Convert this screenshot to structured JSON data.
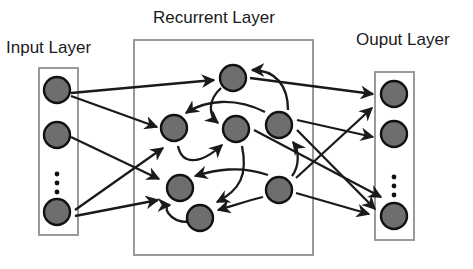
{
  "labels": {
    "input": "Input Layer",
    "recurrent": "Recurrent Layer",
    "output": "Ouput Layer"
  },
  "colors": {
    "node_fill": "#6e6e6e",
    "node_stroke": "#111111",
    "box_stroke": "#9a9a9a",
    "edge": "#1a1a1a",
    "text": "#1a1a1a"
  },
  "layers": {
    "input": {
      "nodes": 3,
      "ellipsis": true
    },
    "recurrent": {
      "nodes": 7
    },
    "output": {
      "nodes": 3,
      "ellipsis": true
    }
  }
}
